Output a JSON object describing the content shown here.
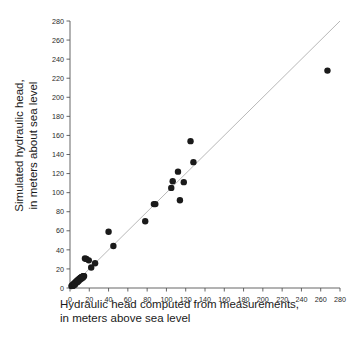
{
  "chart_data": {
    "type": "scatter",
    "title": "",
    "xlabel": "Hydraulic head computed from measurements, in meters above sea level",
    "xlabel_line1": "Hydraulic head computed from measurements,",
    "xlabel_line2": "in meters above sea level",
    "ylabel": "Simulated hydraulic head, in meters about sea level",
    "ylabel_line1": "Simulated hydraulic head,",
    "ylabel_line2": "in meters about sea level",
    "xlim": [
      0,
      280
    ],
    "ylim": [
      0,
      280
    ],
    "xticks": [
      0,
      20,
      40,
      60,
      80,
      100,
      120,
      140,
      160,
      180,
      200,
      220,
      240,
      260,
      280
    ],
    "yticks": [
      0,
      20,
      40,
      60,
      80,
      100,
      120,
      140,
      160,
      180,
      200,
      220,
      240,
      260,
      280
    ],
    "xtick_labels": [
      "0",
      "20",
      "40",
      "60",
      "80",
      "100",
      "120",
      "140",
      "160",
      "180",
      "200",
      "220",
      "240",
      "260",
      "280"
    ],
    "ytick_labels": [
      "0",
      "20",
      "40",
      "60",
      "80",
      "100",
      "120",
      "140",
      "160",
      "180",
      "200",
      "220",
      "240",
      "260",
      "280"
    ],
    "grid": false,
    "legend": null,
    "marker_color": "#1a1a1a",
    "marker_size": 3.2,
    "reference_line": {
      "name": "one-to-one line",
      "color": "#b0b0b0",
      "x": [
        0,
        280
      ],
      "y": [
        0,
        280
      ]
    },
    "series": [
      {
        "name": "Simulated vs computed hydraulic head",
        "points": [
          [
            1.5,
            2.0
          ],
          [
            2.2,
            2.6
          ],
          [
            2.8,
            3.0
          ],
          [
            3.3,
            3.6
          ],
          [
            3.9,
            4.0
          ],
          [
            4.4,
            4.5
          ],
          [
            4.9,
            5.1
          ],
          [
            5.4,
            5.5
          ],
          [
            5.9,
            6.0
          ],
          [
            6.3,
            6.4
          ],
          [
            6.8,
            6.9
          ],
          [
            7.2,
            7.3
          ],
          [
            7.7,
            7.6
          ],
          [
            8.1,
            8.1
          ],
          [
            8.5,
            8.4
          ],
          [
            9.0,
            8.9
          ],
          [
            9.4,
            9.2
          ],
          [
            9.8,
            9.6
          ],
          [
            10.2,
            9.9
          ],
          [
            10.6,
            10.2
          ],
          [
            11.0,
            10.6
          ],
          [
            11.4,
            10.9
          ],
          [
            11.8,
            11.2
          ],
          [
            12.2,
            11.4
          ],
          [
            12.6,
            11.7
          ],
          [
            13.0,
            11.9
          ],
          [
            13.4,
            12.0
          ],
          [
            13.8,
            12.2
          ],
          [
            14.2,
            12.3
          ],
          [
            14.6,
            12.5
          ],
          [
            3.0,
            2.2
          ],
          [
            4.6,
            3.4
          ],
          [
            6.0,
            5.0
          ],
          [
            7.5,
            6.2
          ],
          [
            9.1,
            7.5
          ],
          [
            10.5,
            8.8
          ],
          [
            12.0,
            10.0
          ],
          [
            13.5,
            11.0
          ],
          [
            5.0,
            3.8
          ],
          [
            8.0,
            6.6
          ],
          [
            15.5,
            31.0
          ],
          [
            17.0,
            30.5
          ],
          [
            19.5,
            29.0
          ],
          [
            22.0,
            21.5
          ],
          [
            26.0,
            26.0
          ],
          [
            40.0,
            59.0
          ],
          [
            45.0,
            44.0
          ],
          [
            78.0,
            70.0
          ],
          [
            87.0,
            88.0
          ],
          [
            88.5,
            88.0
          ],
          [
            105.0,
            105.0
          ],
          [
            106.5,
            112.0
          ],
          [
            112.0,
            122.0
          ],
          [
            114.0,
            92.0
          ],
          [
            118.0,
            111.0
          ],
          [
            125.0,
            154.0
          ],
          [
            128.0,
            132.0
          ],
          [
            267.0,
            228.0
          ]
        ]
      }
    ]
  },
  "axes": {
    "plot_left_px": 70,
    "plot_right_px": 340,
    "plot_bottom_px": 288,
    "plot_top_px": 21
  }
}
